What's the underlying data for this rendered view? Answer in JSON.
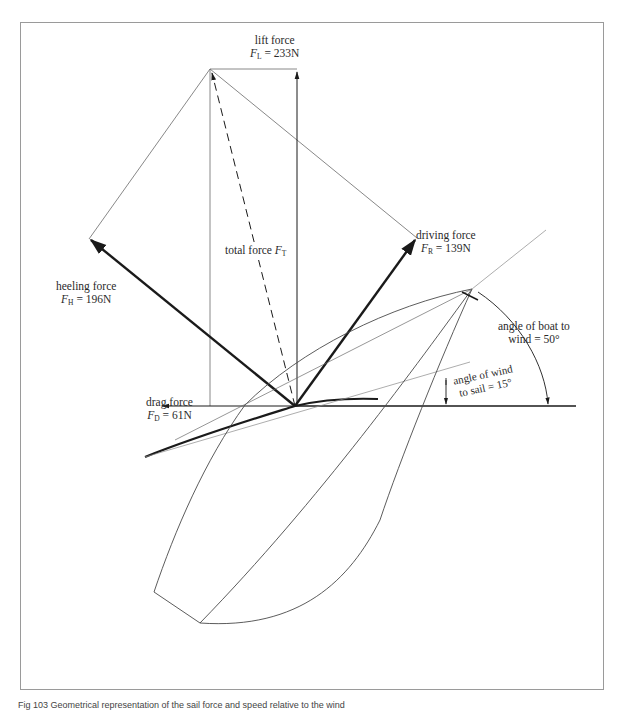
{
  "figure": {
    "caption": "Fig 103  Geometrical representation of the sail force and speed relative to the wind",
    "labels": {
      "lift": {
        "name": "lift force",
        "symbol": "F",
        "sub": "L",
        "value": "= 233N"
      },
      "driving": {
        "name": "driving force",
        "symbol": "F",
        "sub": "R",
        "value": "= 139N"
      },
      "heeling": {
        "name": "heeling force",
        "symbol": "F",
        "sub": "H",
        "value": "= 196N"
      },
      "total": {
        "name": "total force",
        "symbol": "F",
        "sub": "T"
      },
      "drag": {
        "name": "drag force",
        "symbol": "F",
        "sub": "D",
        "value": "= 61N"
      },
      "angle_boat_wind": {
        "line1": "angle of boat to",
        "line2": "wind = 50°"
      },
      "angle_wind_sail": {
        "line1": "angle of wind",
        "line2": "to sail = 15°"
      }
    },
    "colors": {
      "thin_line": "#6a6a6a",
      "thick_line": "#1a1a1a",
      "frame": "#9a9a9a"
    }
  }
}
